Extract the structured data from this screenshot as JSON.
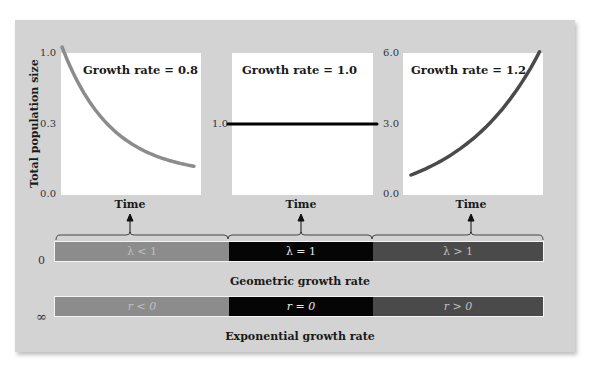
{
  "figure": {
    "y_axis_label": "Total population size",
    "x_axis_label": "Time",
    "colors": {
      "decline": "#8c8c8c",
      "stable": "#000000",
      "growth": "#4a4a4a",
      "panel_bg": "#d3d3d3"
    }
  },
  "chart_data": [
    {
      "type": "line",
      "title": "Growth rate = 0.8",
      "xlabel": "Time",
      "ylabel": "Total population size",
      "yticks": [
        "1.0",
        "0.3",
        "0.0"
      ],
      "ylim": [
        0,
        1.0
      ],
      "growth_rate": 0.8,
      "series": [
        {
          "name": "decline",
          "x": [
            0,
            1,
            2,
            3,
            4,
            5,
            6,
            7,
            8,
            9,
            10,
            11,
            12
          ],
          "y": [
            1.0,
            0.8,
            0.64,
            0.512,
            0.41,
            0.328,
            0.262,
            0.21,
            0.168,
            0.134,
            0.107,
            0.086,
            0.069
          ]
        }
      ]
    },
    {
      "type": "line",
      "title": "Growth rate = 1.0",
      "xlabel": "Time",
      "ylabel": "Total population size",
      "yticks": [
        "1.0"
      ],
      "ylim": [
        0,
        2.0
      ],
      "growth_rate": 1.0,
      "series": [
        {
          "name": "stable",
          "x": [
            0,
            12
          ],
          "y": [
            1.0,
            1.0
          ]
        }
      ]
    },
    {
      "type": "line",
      "title": "Growth rate = 1.2",
      "xlabel": "Time",
      "ylabel": "Total population size",
      "yticks": [
        "6.0",
        "3.0",
        "0.0"
      ],
      "ylim": [
        0,
        6.0
      ],
      "growth_rate": 1.2,
      "series": [
        {
          "name": "growth",
          "x": [
            0,
            1,
            2,
            3,
            4,
            5,
            6,
            7,
            8,
            9,
            10,
            11,
            12
          ],
          "y": [
            1.2,
            1.44,
            1.73,
            2.07,
            2.49,
            2.99,
            3.58,
            4.3,
            5.16,
            6.19,
            7.43,
            8.92,
            10.7
          ]
        }
      ]
    }
  ],
  "rate_bars": {
    "geometric": {
      "caption": "Geometric growth rate",
      "left_value": "0",
      "segments": [
        "λ < 1",
        "λ = 1",
        "λ > 1"
      ]
    },
    "exponential": {
      "caption": "Exponential growth rate",
      "left_value": "∞",
      "segments": [
        "r < 0",
        "r = 0",
        "r > 0"
      ]
    }
  }
}
